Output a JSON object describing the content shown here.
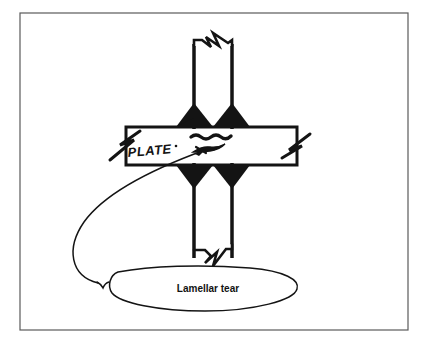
{
  "figure": {
    "kind": "engineering-sketch",
    "background_color": "#ffffff",
    "ink_color": "#141414"
  },
  "frame": {
    "name": "figure-border",
    "x": 20,
    "y": 13,
    "width": 388,
    "height": 317,
    "stroke_color": "#555555",
    "stroke_width": 1.2
  },
  "members": {
    "plate": {
      "label": "PLATE",
      "x": 122,
      "y": 127,
      "width": 178,
      "height": 38,
      "stroke_color": "#141414",
      "fill": "#ffffff"
    },
    "column": {
      "label": "",
      "x": 194,
      "y": 36,
      "width": 38,
      "height": 222,
      "stroke_color": "#141414",
      "fill": "#ffffff"
    }
  },
  "welds": {
    "fill_color": "#141414",
    "items": [
      {
        "name": "weld-top-left",
        "position": "top-left"
      },
      {
        "name": "weld-top-right",
        "position": "top-right"
      },
      {
        "name": "weld-bottom-left",
        "position": "bottom-left"
      },
      {
        "name": "weld-bottom-right",
        "position": "bottom-right"
      }
    ]
  },
  "break_symbols": [
    {
      "name": "break-symbol-column-top",
      "location": "column top end"
    },
    {
      "name": "break-symbol-column-bottom",
      "location": "column bottom end"
    },
    {
      "name": "break-symbol-plate-left",
      "location": "plate left end"
    },
    {
      "name": "break-symbol-plate-right",
      "location": "plate right end"
    }
  ],
  "tear_marks": {
    "name": "lamellar-tear-cracks",
    "count": 2,
    "description": "two wavy horizontal crack lines inside the plate thickness",
    "color": "#141414"
  },
  "callout": {
    "text": "Lamellar tear",
    "balloon": {
      "name": "callout-balloon",
      "cx": 208,
      "cy": 289,
      "rx": 90,
      "ry": 23
    },
    "leader": {
      "name": "callout-leader-line",
      "has_arrowhead": true,
      "points_to": "plate mid-thickness at tear location"
    }
  },
  "text_items": [
    {
      "name": "plate-label",
      "value": "PLATE"
    },
    {
      "name": "callout-label",
      "value": "Lamellar tear"
    }
  ]
}
